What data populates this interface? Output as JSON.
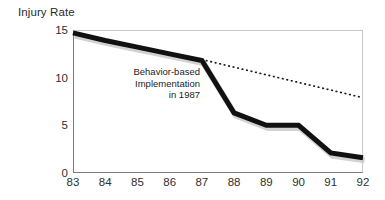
{
  "chart_data": {
    "type": "line",
    "title": "Injury Rate",
    "xlabel": "",
    "ylabel": "Injury Rate",
    "grid": false,
    "legend": "none",
    "xlim": [
      83,
      92
    ],
    "ylim": [
      0,
      15
    ],
    "x": [
      83,
      84,
      85,
      86,
      87,
      88,
      89,
      90,
      91,
      92
    ],
    "xtick_labels": [
      "83",
      "84",
      "85",
      "86",
      "87",
      "88",
      "89",
      "90",
      "91",
      "92"
    ],
    "ytick_labels": [
      "15",
      "10",
      "5",
      "0"
    ],
    "ytick_values": [
      15,
      10,
      5,
      0
    ],
    "series": [
      {
        "name": "Actual injury rate",
        "style": "solid-thick-black",
        "color": "#111111",
        "x": [
          83,
          84,
          85,
          86,
          87,
          88,
          89,
          90,
          91,
          92
        ],
        "values": [
          14.7,
          13.9,
          13.2,
          12.5,
          11.8,
          6.3,
          5.0,
          5.0,
          2.1,
          1.6
        ]
      },
      {
        "name": "Projected trend without intervention",
        "style": "dotted",
        "color": "#1a1a1a",
        "x": [
          87,
          92
        ],
        "values": [
          11.9,
          7.9
        ]
      }
    ],
    "annotations": [
      {
        "name": "behavior-based-implementation-note",
        "lines": [
          "Behavior-based",
          "Implementation",
          "in 1987"
        ],
        "align": "right",
        "at_x": 87
      }
    ],
    "colors": {
      "series_line": "#111111",
      "series_shadow": "#d2d2d2",
      "projection_line": "#1a1a1a",
      "axis_dark": "#7d7d7d",
      "axis_light": "#c9c9c9",
      "text": "#2f2f2f",
      "background": "#ffffff"
    }
  }
}
